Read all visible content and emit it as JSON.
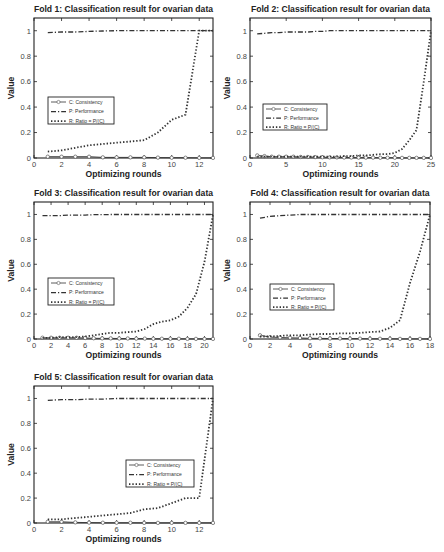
{
  "figure": {
    "width": 444,
    "height": 552,
    "background": "#ffffff",
    "line_color": "#333333",
    "axis_color": "#222222"
  },
  "chart_data": [
    {
      "type": "line",
      "title": "Fold 1: Classification result for ovarian data",
      "xlabel": "Optimizing rounds",
      "ylabel": "Value",
      "xlim": [
        0,
        13
      ],
      "ylim": [
        0,
        1.1
      ],
      "xticks": [
        0,
        2,
        4,
        6,
        8,
        10,
        12
      ],
      "yticks": [
        0,
        0.2,
        0.4,
        0.6,
        0.8,
        1
      ],
      "ytick_labels": [
        "0",
        "0.2",
        "0.4",
        "0.6",
        "0.8",
        "1"
      ],
      "grid": false,
      "legend": {
        "position": "center-left",
        "entries": [
          "C: Consistency",
          "P: Performance",
          "R: Ratio = P/(C)"
        ]
      },
      "x": [
        1,
        2,
        3,
        4,
        5,
        6,
        7,
        8,
        9,
        10,
        11,
        12,
        13
      ],
      "series": [
        {
          "name": "C: Consistency",
          "style": "solid-circle",
          "values": [
            0.01,
            0.01,
            0.01,
            0.01,
            0.005,
            0.005,
            0.005,
            0.005,
            0.003,
            0.002,
            0.002,
            0.001,
            0.001
          ]
        },
        {
          "name": "P: Performance",
          "style": "dash-dot",
          "values": [
            0.985,
            0.99,
            0.99,
            0.995,
            0.998,
            1.0,
            1.0,
            1.0,
            1.0,
            1.0,
            1.0,
            1.0,
            1.0
          ]
        },
        {
          "name": "R: Ratio = P/(C)",
          "style": "dotted",
          "values": [
            0.05,
            0.06,
            0.08,
            0.1,
            0.11,
            0.12,
            0.13,
            0.14,
            0.2,
            0.3,
            0.34,
            1.0,
            1.0
          ]
        }
      ]
    },
    {
      "type": "line",
      "title": "Fold 2: Classification result for ovarian data",
      "xlabel": "Optimizing rounds",
      "ylabel": "Value",
      "xlim": [
        0,
        25
      ],
      "ylim": [
        0,
        1.1
      ],
      "xticks": [
        0,
        5,
        10,
        15,
        20,
        25
      ],
      "yticks": [
        0,
        0.2,
        0.4,
        0.6,
        0.8,
        1
      ],
      "ytick_labels": [
        "0",
        "0.2",
        "0.4",
        "0.6",
        "0.8",
        "1"
      ],
      "grid": false,
      "legend": {
        "position": "center-left",
        "entries": [
          "C: Consistency",
          "P: Performance",
          "R: Ratio = P/(C)"
        ]
      },
      "x": [
        1,
        2,
        3,
        4,
        5,
        6,
        7,
        8,
        9,
        10,
        11,
        12,
        13,
        14,
        15,
        16,
        17,
        18,
        19,
        20,
        21,
        22,
        23,
        24,
        25
      ],
      "series": [
        {
          "name": "C: Consistency",
          "style": "solid-circle",
          "values": [
            0.02,
            0.015,
            0.01,
            0.01,
            0.01,
            0.01,
            0.008,
            0.008,
            0.007,
            0.006,
            0.005,
            0.005,
            0.004,
            0.004,
            0.003,
            0.003,
            0.003,
            0.002,
            0.002,
            0.002,
            0.001,
            0.001,
            0.001,
            0.001,
            0.001
          ]
        },
        {
          "name": "P: Performance",
          "style": "dash-dot",
          "values": [
            0.975,
            0.98,
            0.985,
            0.985,
            0.99,
            0.99,
            0.99,
            0.99,
            0.995,
            0.995,
            1.0,
            1.0,
            1.0,
            1.0,
            1.0,
            1.0,
            1.0,
            1.0,
            1.0,
            1.0,
            1.0,
            1.0,
            1.0,
            1.0,
            1.0
          ]
        },
        {
          "name": "R: Ratio = P/(C)",
          "style": "dotted",
          "values": [
            0.01,
            0.01,
            0.01,
            0.01,
            0.01,
            0.01,
            0.01,
            0.01,
            0.01,
            0.01,
            0.01,
            0.01,
            0.015,
            0.015,
            0.02,
            0.02,
            0.025,
            0.03,
            0.03,
            0.04,
            0.07,
            0.14,
            0.22,
            0.6,
            1.0
          ]
        }
      ]
    },
    {
      "type": "line",
      "title": "Fold 3: Classification result for ovarian data",
      "xlabel": "Optimizing rounds",
      "ylabel": "Value",
      "xlim": [
        0,
        21
      ],
      "ylim": [
        0,
        1.1
      ],
      "xticks": [
        0,
        2,
        4,
        6,
        8,
        10,
        12,
        14,
        16,
        18,
        20
      ],
      "yticks": [
        0,
        0.2,
        0.4,
        0.6,
        0.8,
        1
      ],
      "ytick_labels": [
        "0",
        "0.2",
        "0.4",
        "0.6",
        "0.8",
        "1"
      ],
      "grid": false,
      "legend": {
        "position": "center-left",
        "entries": [
          "C: Consistency",
          "P: Performance",
          "R: Ratio = P/(C)"
        ]
      },
      "x": [
        1,
        2,
        3,
        4,
        5,
        6,
        7,
        8,
        9,
        10,
        11,
        12,
        13,
        14,
        15,
        16,
        17,
        18,
        19,
        20,
        21
      ],
      "series": [
        {
          "name": "C: Consistency",
          "style": "solid-circle",
          "values": [
            0.01,
            0.01,
            0.01,
            0.01,
            0.01,
            0.008,
            0.006,
            0.005,
            0.005,
            0.004,
            0.004,
            0.003,
            0.003,
            0.002,
            0.002,
            0.002,
            0.002,
            0.001,
            0.001,
            0.001,
            0.001
          ]
        },
        {
          "name": "P: Performance",
          "style": "dash-dot",
          "values": [
            0.99,
            0.99,
            0.99,
            0.995,
            0.995,
            0.995,
            0.998,
            0.998,
            1.0,
            1.0,
            1.0,
            1.0,
            1.0,
            1.0,
            1.0,
            1.0,
            1.0,
            1.0,
            1.0,
            1.0,
            1.0
          ]
        },
        {
          "name": "R: Ratio = P/(C)",
          "style": "dotted",
          "values": [
            0.01,
            0.01,
            0.015,
            0.015,
            0.015,
            0.02,
            0.03,
            0.04,
            0.05,
            0.05,
            0.055,
            0.06,
            0.08,
            0.12,
            0.14,
            0.15,
            0.18,
            0.25,
            0.36,
            0.62,
            1.0
          ]
        }
      ]
    },
    {
      "type": "line",
      "title": "Fold 4: Classification result for ovarian data",
      "xlabel": "Optimizing rounds",
      "ylabel": "Value",
      "xlim": [
        0,
        18
      ],
      "ylim": [
        0,
        1.1
      ],
      "xticks": [
        0,
        2,
        4,
        6,
        8,
        10,
        12,
        14,
        16,
        18
      ],
      "yticks": [
        0,
        0.2,
        0.4,
        0.6,
        0.8,
        1
      ],
      "ytick_labels": [
        "0",
        "0.2",
        "0.4",
        "0.6",
        "0.8",
        "1"
      ],
      "grid": false,
      "legend": {
        "position": "center-left",
        "entries": [
          "C: Consistency",
          "P: Performance",
          "R: Ratio = P/(C)"
        ]
      },
      "x": [
        1,
        2,
        3,
        4,
        5,
        6,
        7,
        8,
        9,
        10,
        11,
        12,
        13,
        14,
        15,
        16,
        17,
        18
      ],
      "series": [
        {
          "name": "C: Consistency",
          "style": "solid-circle",
          "values": [
            0.03,
            0.015,
            0.012,
            0.01,
            0.008,
            0.006,
            0.005,
            0.004,
            0.004,
            0.003,
            0.003,
            0.002,
            0.002,
            0.002,
            0.001,
            0.001,
            0.001,
            0.001
          ]
        },
        {
          "name": "P: Performance",
          "style": "dash-dot",
          "values": [
            0.97,
            0.985,
            0.99,
            0.995,
            1.0,
            1.0,
            1.0,
            1.0,
            1.0,
            1.0,
            1.0,
            1.0,
            1.0,
            1.0,
            1.0,
            1.0,
            1.0,
            1.0
          ]
        },
        {
          "name": "R: Ratio = P/(C)",
          "style": "dotted",
          "values": [
            0.02,
            0.02,
            0.025,
            0.03,
            0.03,
            0.035,
            0.04,
            0.04,
            0.045,
            0.045,
            0.05,
            0.055,
            0.06,
            0.09,
            0.15,
            0.45,
            0.7,
            1.0
          ]
        }
      ]
    },
    {
      "type": "line",
      "title": "Fold 5: Classification result for ovarian data",
      "xlabel": "Optimizing rounds",
      "ylabel": "Value",
      "xlim": [
        0,
        13
      ],
      "ylim": [
        0,
        1.1
      ],
      "xticks": [
        0,
        2,
        4,
        6,
        8,
        10,
        12
      ],
      "yticks": [
        0,
        0.2,
        0.4,
        0.6,
        0.8,
        1
      ],
      "ytick_labels": [
        "0",
        "0.2",
        "0.4",
        "0.6",
        "0.8",
        "1"
      ],
      "grid": false,
      "legend": {
        "position": "center-right",
        "entries": [
          "C: Consistency",
          "P: Performance",
          "R: Ratio = P/(C)"
        ]
      },
      "x": [
        1,
        2,
        3,
        4,
        5,
        6,
        7,
        8,
        9,
        10,
        11,
        12,
        13
      ],
      "series": [
        {
          "name": "C: Consistency",
          "style": "solid-circle",
          "values": [
            0.01,
            0.01,
            0.005,
            0.003,
            0.002,
            0.002,
            0.002,
            0.001,
            0.001,
            0.001,
            0.001,
            0.001,
            0.001
          ]
        },
        {
          "name": "P: Performance",
          "style": "dash-dot",
          "values": [
            0.985,
            0.99,
            0.99,
            0.995,
            0.995,
            1.0,
            1.0,
            1.0,
            1.0,
            1.0,
            1.0,
            1.0,
            1.0
          ]
        },
        {
          "name": "R: Ratio = P/(C)",
          "style": "dotted",
          "values": [
            0.03,
            0.03,
            0.04,
            0.05,
            0.06,
            0.07,
            0.08,
            0.11,
            0.12,
            0.16,
            0.2,
            0.2,
            1.0
          ]
        }
      ]
    }
  ],
  "layout": {
    "panels": [
      {
        "left": 34,
        "right": 213,
        "top": 18,
        "bottom": 158,
        "title_y": 12,
        "legend": {
          "x": 48,
          "y": 97,
          "w": 66,
          "h": 27
        }
      },
      {
        "left": 250,
        "right": 431,
        "top": 18,
        "bottom": 158,
        "title_y": 12,
        "legend": {
          "x": 263,
          "y": 104,
          "w": 64,
          "h": 26
        }
      },
      {
        "left": 34,
        "right": 213,
        "top": 202,
        "bottom": 339,
        "title_y": 196,
        "legend": {
          "x": 48,
          "y": 278,
          "w": 66,
          "h": 27
        }
      },
      {
        "left": 250,
        "right": 430,
        "top": 202,
        "bottom": 339,
        "title_y": 196,
        "legend": {
          "x": 270,
          "y": 284,
          "w": 64,
          "h": 26
        }
      },
      {
        "left": 34,
        "right": 213,
        "top": 386,
        "bottom": 523,
        "title_y": 380,
        "legend": {
          "x": 126,
          "y": 460,
          "w": 68,
          "h": 27
        }
      }
    ]
  }
}
